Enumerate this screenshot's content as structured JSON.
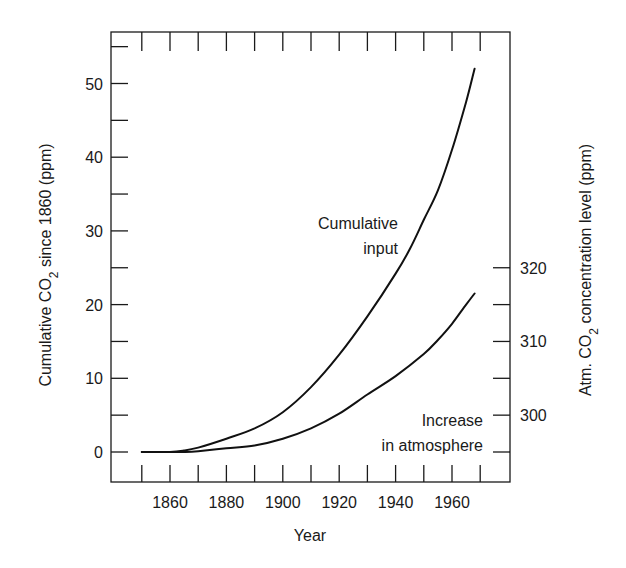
{
  "chart_data": {
    "type": "line",
    "title": "",
    "xlabel": "Year",
    "ylabel": "Cumulative CO₂ since 1860 (ppm)",
    "ylabel_parts": {
      "pre": "Cumulative CO",
      "sub": "2",
      "post": " since 1860 (ppm)"
    },
    "y2label": "Atm. CO₂ concentration level (ppm)",
    "y2label_parts": {
      "pre": "Atm. CO",
      "sub": "2",
      "post": " concentration level (ppm)"
    },
    "xlim": [
      1843,
      1984
    ],
    "ylim": [
      -4.1,
      56.5
    ],
    "y2lim": [
      290.9,
      351.5
    ],
    "x_major_ticks": [
      1860,
      1880,
      1900,
      1920,
      1940,
      1960
    ],
    "x_minor_ticks": [
      1850,
      1860,
      1870,
      1880,
      1890,
      1900,
      1910,
      1920,
      1930,
      1940,
      1950,
      1960,
      1970
    ],
    "y_major_ticks": [
      0,
      10,
      20,
      30,
      40,
      50
    ],
    "y_minor_ticks": [
      0,
      5,
      10,
      15,
      20,
      25,
      30,
      35,
      40,
      45,
      50,
      55
    ],
    "y2_major_ticks": [
      300,
      310,
      320
    ],
    "y2_minor_ticks": [
      295,
      300,
      305,
      310,
      315,
      320
    ],
    "grid": false,
    "legend": null,
    "series": [
      {
        "name": "Cumulative input",
        "axis": "left",
        "x": [
          1850,
          1860,
          1865,
          1870,
          1880,
          1890,
          1900,
          1910,
          1920,
          1930,
          1940,
          1945,
          1950,
          1955,
          1960,
          1965,
          1968
        ],
        "values": [
          0,
          0,
          0.2,
          0.6,
          1.8,
          3.2,
          5.4,
          8.8,
          13.2,
          18.4,
          24.2,
          27.5,
          31.5,
          35.5,
          41,
          47.5,
          52
        ]
      },
      {
        "name": "Increase in atmosphere",
        "axis": "left",
        "x": [
          1850,
          1860,
          1865,
          1870,
          1880,
          1890,
          1900,
          1910,
          1920,
          1930,
          1940,
          1950,
          1955,
          1960,
          1965,
          1968
        ],
        "values": [
          0,
          0,
          0,
          0.1,
          0.5,
          0.9,
          1.8,
          3.2,
          5.2,
          7.8,
          10.3,
          13.3,
          15.2,
          17.4,
          20,
          21.5
        ],
        "values_right_axis_ppm": [
          295,
          295,
          295,
          295.1,
          295.5,
          295.9,
          296.8,
          298.2,
          300.2,
          302.8,
          305.3,
          308.3,
          310.2,
          312.4,
          315,
          316.5
        ]
      }
    ],
    "annotations": [
      {
        "lines": [
          "Cumulative",
          "input"
        ],
        "near_series": "Cumulative input"
      },
      {
        "lines": [
          "Increase",
          "in atmosphere"
        ],
        "near_series": "Increase in atmosphere"
      }
    ]
  },
  "labels": {
    "x_ticks": [
      "1860",
      "1880",
      "1900",
      "1920",
      "1940",
      "1960"
    ],
    "y_ticks": [
      "0",
      "10",
      "20",
      "30",
      "40",
      "50"
    ],
    "y2_ticks": [
      "300",
      "310",
      "320"
    ],
    "xlabel": "Year",
    "ylabel_pre": "Cumulative CO",
    "ylabel_sub": "2",
    "ylabel_post": " since 1860 (ppm)",
    "y2label_pre": "Atm. CO",
    "y2label_sub": "2",
    "y2label_post": " concentration level (ppm)",
    "annot_cum_1": "Cumulative",
    "annot_cum_2": "input",
    "annot_atm_1": "Increase",
    "annot_atm_2": "in atmosphere"
  },
  "colors": {
    "line": "#111111",
    "axis": "#1a1a1a",
    "background": "#ffffff"
  }
}
